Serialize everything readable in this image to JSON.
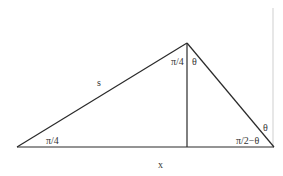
{
  "diagram": {
    "type": "geometry",
    "colors": {
      "stroke": "#2a2a2a",
      "faint_line": "#cfcfcf",
      "text": "#333333",
      "background": "#ffffff"
    },
    "vertices": {
      "left": [
        17,
        147
      ],
      "apex": [
        187,
        43
      ],
      "right": [
        274,
        147
      ],
      "foot": [
        187,
        147
      ]
    },
    "labels": {
      "side_s": "s",
      "base_x": "x",
      "angle_left": "π/4",
      "angle_apex_left": "π/4",
      "angle_apex_right": "θ",
      "angle_right": "π/2−θ",
      "angle_right_outer": "θ"
    }
  }
}
